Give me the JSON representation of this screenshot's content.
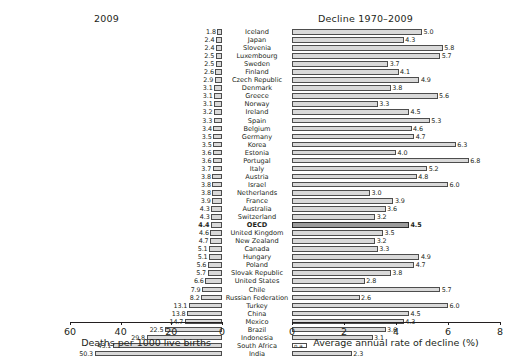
{
  "chart_data": {
    "type": "bar",
    "title": "",
    "panels": [
      {
        "name": "left",
        "title": "2009",
        "xlabel": "Deaths per 1000 live births",
        "xlim": [
          60,
          0
        ],
        "direction": "rtl",
        "ticks": [
          60,
          40,
          20,
          0
        ],
        "tick_labels": [
          "60",
          "40",
          "20",
          "0"
        ]
      },
      {
        "name": "right",
        "title": "Decline 1970–2009",
        "xlabel": "Average annual rate of decline (%)",
        "xlim": [
          0,
          8
        ],
        "direction": "ltr",
        "ticks": [
          0,
          2,
          4,
          6,
          8
        ],
        "tick_labels": [
          "0",
          "2",
          "4",
          "6",
          "8"
        ]
      }
    ],
    "categories": [
      "Iceland",
      "Japan",
      "Slovenia",
      "Luxembourg",
      "Sweden",
      "Finland",
      "Czech Republic",
      "Denmark",
      "Greece",
      "Norway",
      "Ireland",
      "Spain",
      "Belgium",
      "Germany",
      "Korea",
      "Estonia",
      "Portugal",
      "Italy",
      "Austria",
      "Israel",
      "Netherlands",
      "France",
      "Australia",
      "Switzerland",
      "OECD",
      "United Kingdom",
      "New Zealand",
      "Canada",
      "Hungary",
      "Poland",
      "Slovak Republic",
      "United States",
      "Chile",
      "Russian Federation",
      "Turkey",
      "China",
      "Mexico",
      "Brazil",
      "Indonesia",
      "South Africa",
      "India"
    ],
    "series": [
      {
        "name": "2009",
        "panel": "left",
        "unit": "deaths per 1000 live births",
        "values": [
          1.8,
          2.4,
          2.4,
          2.5,
          2.5,
          2.6,
          2.9,
          3.1,
          3.1,
          3.1,
          3.2,
          3.3,
          3.4,
          3.5,
          3.5,
          3.6,
          3.6,
          3.7,
          3.8,
          3.8,
          3.8,
          3.9,
          4.3,
          4.3,
          4.4,
          4.6,
          4.7,
          5.1,
          5.1,
          5.6,
          5.7,
          6.6,
          7.9,
          8.2,
          13.1,
          13.8,
          14.7,
          22.5,
          29.8,
          43.1,
          50.3
        ],
        "labels": [
          "1.8",
          "2.4",
          "2.4",
          "2.5",
          "2.5",
          "2.6",
          "2.9",
          "3.1",
          "3.1",
          "3.1",
          "3.2",
          "3.3",
          "3.4",
          "3.5",
          "3.5",
          "3.6",
          "3.6",
          "3.7",
          "3.8",
          "3.8",
          "3.8",
          "3.9",
          "4.3",
          "4.3",
          "4.4",
          "4.6",
          "4.7",
          "5.1",
          "5.1",
          "5.6",
          "5.7",
          "6.6",
          "7.9",
          "8.2",
          "13.1",
          "13.8",
          "14.7",
          "22.5",
          "29.8",
          "43.1",
          "50.3"
        ]
      },
      {
        "name": "Decline 1970-2009",
        "panel": "right",
        "unit": "average annual rate of decline (%)",
        "values": [
          5.0,
          4.3,
          5.8,
          5.7,
          3.7,
          4.1,
          4.9,
          3.8,
          5.6,
          3.3,
          4.5,
          5.3,
          4.6,
          4.7,
          6.3,
          4.0,
          6.8,
          5.2,
          4.8,
          6.0,
          3.0,
          3.9,
          3.6,
          3.2,
          4.5,
          3.5,
          3.2,
          3.3,
          4.9,
          4.7,
          3.8,
          2.8,
          5.7,
          2.6,
          6.0,
          4.5,
          4.3,
          3.6,
          3.1,
          null,
          2.3
        ],
        "labels": [
          "5.0",
          "4.3",
          "5.8",
          "5.7",
          "3.7",
          "4.1",
          "4.9",
          "3.8",
          "5.6",
          "3.3",
          "4.5",
          "5.3",
          "4.6",
          "4.7",
          "6.3",
          "4.0",
          "6.8",
          "5.2",
          "4.8",
          "6.0",
          "3.0",
          "3.9",
          "3.6",
          "3.2",
          "4.5",
          "3.5",
          "3.2",
          "3.3",
          "4.9",
          "4.7",
          "3.8",
          "2.8",
          "5.7",
          "2.6",
          "6.0",
          "4.5",
          "4.3",
          "3.6",
          "3.1",
          "n.a.",
          "2.3"
        ]
      }
    ],
    "highlight": {
      "category": "OECD",
      "index": 24,
      "bold": true
    },
    "colors": {
      "bar_fill": "#d9d9d9",
      "bar_stroke": "#4d4d4d",
      "highlight_fill": "#9b9b9b",
      "text": "#231f20",
      "background": "#ffffff"
    },
    "grid": false,
    "legend": "none"
  }
}
